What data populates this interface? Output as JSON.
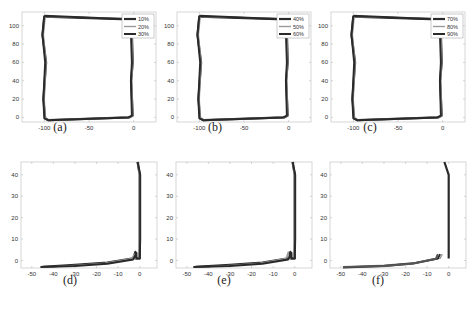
{
  "chart_data": [
    {
      "id": "a",
      "caption": "(a)",
      "type": "line",
      "xlim": [
        -125,
        25
      ],
      "ylim": [
        -5,
        115
      ],
      "xticks": [
        -100,
        -50,
        0
      ],
      "yticks": [
        0,
        20,
        40,
        60,
        80,
        100
      ],
      "legend": [
        "10%",
        "20%",
        "30%"
      ],
      "legend_position": "upper right",
      "series": [
        {
          "name": "10%",
          "path": [
            [
              -100,
              110
            ],
            [
              -5,
              107
            ],
            [
              -2,
              90
            ],
            [
              -1,
              60
            ],
            [
              -3,
              40
            ],
            [
              -1,
              2
            ],
            [
              -5,
              0
            ],
            [
              -95,
              -3
            ],
            [
              -99,
              -1
            ],
            [
              -101,
              20
            ],
            [
              -98,
              60
            ],
            [
              -102,
              90
            ],
            [
              -100,
              110
            ]
          ]
        },
        {
          "name": "20%",
          "path": [
            [
              -99,
              110
            ],
            [
              -5,
              108
            ],
            [
              -2,
              90
            ],
            [
              -1,
              60
            ],
            [
              -2,
              40
            ],
            [
              -1,
              2
            ],
            [
              -5,
              0
            ],
            [
              -95,
              -3
            ],
            [
              -99,
              -1
            ],
            [
              -100,
              20
            ],
            [
              -98,
              60
            ],
            [
              -101,
              90
            ],
            [
              -99,
              110
            ]
          ]
        },
        {
          "name": "30%",
          "path": [
            [
              -100,
              111
            ],
            [
              -6,
              107
            ],
            [
              -3,
              90
            ],
            [
              -2,
              60
            ],
            [
              -3,
              40
            ],
            [
              -2,
              2
            ],
            [
              -6,
              0
            ],
            [
              -96,
              -3
            ],
            [
              -100,
              -1
            ],
            [
              -101,
              20
            ],
            [
              -99,
              60
            ],
            [
              -102,
              90
            ],
            [
              -100,
              111
            ]
          ]
        }
      ]
    },
    {
      "id": "b",
      "caption": "(b)",
      "type": "line",
      "xlim": [
        -125,
        25
      ],
      "ylim": [
        -5,
        115
      ],
      "xticks": [
        -100,
        -50,
        0
      ],
      "yticks": [
        0,
        20,
        40,
        60,
        80,
        100
      ],
      "legend": [
        "40%",
        "50%",
        "60%"
      ],
      "legend_position": "upper right",
      "series": [
        {
          "name": "40%",
          "path": [
            [
              -100,
              110
            ],
            [
              -5,
              107
            ],
            [
              -2,
              90
            ],
            [
              -1,
              60
            ],
            [
              -3,
              40
            ],
            [
              -1,
              2
            ],
            [
              -5,
              0
            ],
            [
              -95,
              -3
            ],
            [
              -99,
              -1
            ],
            [
              -101,
              20
            ],
            [
              -98,
              60
            ],
            [
              -102,
              90
            ],
            [
              -100,
              110
            ]
          ]
        },
        {
          "name": "50%",
          "path": [
            [
              -99,
              110
            ],
            [
              -5,
              108
            ],
            [
              -2,
              90
            ],
            [
              -1,
              60
            ],
            [
              -2,
              40
            ],
            [
              -1,
              2
            ],
            [
              -5,
              0
            ],
            [
              -95,
              -3
            ],
            [
              -99,
              -1
            ],
            [
              -100,
              20
            ],
            [
              -98,
              60
            ],
            [
              -101,
              90
            ],
            [
              -99,
              110
            ]
          ]
        },
        {
          "name": "60%",
          "path": [
            [
              -100,
              111
            ],
            [
              -6,
              107
            ],
            [
              -3,
              90
            ],
            [
              -2,
              60
            ],
            [
              -3,
              40
            ],
            [
              -2,
              2
            ],
            [
              -6,
              0
            ],
            [
              -96,
              -3
            ],
            [
              -100,
              -1
            ],
            [
              -101,
              20
            ],
            [
              -99,
              60
            ],
            [
              -102,
              90
            ],
            [
              -100,
              111
            ]
          ]
        }
      ]
    },
    {
      "id": "c",
      "caption": "(c)",
      "type": "line",
      "xlim": [
        -125,
        25
      ],
      "ylim": [
        -5,
        115
      ],
      "xticks": [
        -100,
        -50,
        0
      ],
      "yticks": [
        0,
        20,
        40,
        60,
        80,
        100
      ],
      "legend": [
        "70%",
        "80%",
        "90%"
      ],
      "legend_position": "upper right",
      "series": [
        {
          "name": "70%",
          "path": [
            [
              -100,
              110
            ],
            [
              -5,
              107
            ],
            [
              -2,
              90
            ],
            [
              -1,
              60
            ],
            [
              -3,
              40
            ],
            [
              -1,
              2
            ],
            [
              -5,
              0
            ],
            [
              -95,
              -3
            ],
            [
              -99,
              -1
            ],
            [
              -101,
              20
            ],
            [
              -98,
              60
            ],
            [
              -102,
              90
            ],
            [
              -100,
              110
            ]
          ]
        },
        {
          "name": "80%",
          "path": [
            [
              -99,
              110
            ],
            [
              -5,
              108
            ],
            [
              -2,
              90
            ],
            [
              -1,
              60
            ],
            [
              -2,
              40
            ],
            [
              -1,
              2
            ],
            [
              -5,
              0
            ],
            [
              -95,
              -3
            ],
            [
              -99,
              -1
            ],
            [
              -100,
              20
            ],
            [
              -98,
              60
            ],
            [
              -101,
              90
            ],
            [
              -99,
              110
            ]
          ]
        },
        {
          "name": "90%",
          "path": [
            [
              -100,
              111
            ],
            [
              -6,
              107
            ],
            [
              -3,
              90
            ],
            [
              -2,
              60
            ],
            [
              -3,
              40
            ],
            [
              -2,
              2
            ],
            [
              -6,
              0
            ],
            [
              -96,
              -3
            ],
            [
              -100,
              -1
            ],
            [
              -101,
              20
            ],
            [
              -99,
              60
            ],
            [
              -102,
              90
            ],
            [
              -100,
              111
            ]
          ]
        }
      ]
    },
    {
      "id": "d",
      "caption": "(d)",
      "type": "line",
      "xlim": [
        -55,
        8
      ],
      "ylim": [
        -3.5,
        46
      ],
      "xticks": [
        -50,
        -40,
        -30,
        -20,
        -10,
        0
      ],
      "yticks": [
        0,
        10,
        20,
        30,
        40
      ],
      "series": [
        {
          "name": "run-1",
          "path": [
            [
              -1,
              46
            ],
            [
              0,
              40
            ],
            [
              0,
              10
            ],
            [
              0,
              1
            ],
            [
              -2,
              1
            ],
            [
              -2,
              4
            ],
            [
              -3,
              1
            ],
            [
              -15,
              -1
            ],
            [
              -30,
              -2
            ],
            [
              -45,
              -3
            ]
          ]
        },
        {
          "name": "run-2",
          "path": [
            [
              -1,
              46
            ],
            [
              -0.3,
              40
            ],
            [
              -0.3,
              10
            ],
            [
              -0.5,
              1
            ],
            [
              -2.5,
              1
            ],
            [
              -2.5,
              3
            ],
            [
              -3.5,
              1
            ],
            [
              -16,
              -1.2
            ],
            [
              -30,
              -2.3
            ],
            [
              -45,
              -3.2
            ]
          ]
        },
        {
          "name": "run-3",
          "path": [
            [
              -1,
              46
            ],
            [
              0.2,
              40
            ],
            [
              0.2,
              10
            ],
            [
              0,
              1
            ],
            [
              -1.5,
              1
            ],
            [
              -1.5,
              3.5
            ],
            [
              -3,
              0.5
            ],
            [
              -15,
              -1.5
            ],
            [
              -30,
              -2.5
            ],
            [
              -46,
              -3
            ]
          ]
        }
      ]
    },
    {
      "id": "e",
      "caption": "(e)",
      "type": "line",
      "xlim": [
        -55,
        8
      ],
      "ylim": [
        -3.5,
        46
      ],
      "xticks": [
        -50,
        -40,
        -30,
        -20,
        -10,
        0
      ],
      "yticks": [
        0,
        10,
        20,
        30,
        40
      ],
      "series": [
        {
          "name": "run-1",
          "path": [
            [
              -1,
              46
            ],
            [
              0,
              40
            ],
            [
              0,
              10
            ],
            [
              0,
              1
            ],
            [
              -2,
              1
            ],
            [
              -2,
              4
            ],
            [
              -3,
              1
            ],
            [
              -15,
              -1
            ],
            [
              -30,
              -2
            ],
            [
              -46,
              -3
            ]
          ]
        },
        {
          "name": "run-2",
          "path": [
            [
              -1,
              46
            ],
            [
              -0.3,
              40
            ],
            [
              -0.3,
              10
            ],
            [
              -0.5,
              1
            ],
            [
              -3,
              1
            ],
            [
              -3,
              4
            ],
            [
              -4,
              1
            ],
            [
              -16,
              -1.2
            ],
            [
              -30,
              -2.3
            ],
            [
              -46,
              -3.2
            ]
          ]
        },
        {
          "name": "run-3",
          "path": [
            [
              -1,
              46
            ],
            [
              0.2,
              40
            ],
            [
              0.2,
              10
            ],
            [
              0,
              1
            ],
            [
              -1.5,
              1
            ],
            [
              -1.5,
              3.5
            ],
            [
              -3,
              0.5
            ],
            [
              -15,
              -1.5
            ],
            [
              -30,
              -2.5
            ],
            [
              -47,
              -3
            ]
          ]
        }
      ]
    },
    {
      "id": "f",
      "caption": "(f)",
      "type": "line",
      "xlim": [
        -55,
        8
      ],
      "ylim": [
        -3.5,
        46
      ],
      "xticks": [
        -50,
        -40,
        -30,
        -20,
        -10,
        0
      ],
      "yticks": [
        0,
        10,
        20,
        30,
        40
      ],
      "series": [
        {
          "name": "run-1",
          "path": [
            [
              -2,
              46
            ],
            [
              0,
              40
            ],
            [
              0,
              10
            ],
            [
              0,
              1
            ]
          ]
        },
        {
          "name": "run-2",
          "path": [
            [
              -3,
              3
            ],
            [
              -4,
              1
            ],
            [
              -15,
              -1
            ],
            [
              -30,
              -2.2
            ],
            [
              -48,
              -3
            ]
          ]
        },
        {
          "name": "run-3",
          "path": [
            [
              -4,
              3
            ],
            [
              -5,
              1
            ],
            [
              -16,
              -1.3
            ],
            [
              -30,
              -2.5
            ],
            [
              -49,
              -3.2
            ]
          ]
        },
        {
          "name": "run-4",
          "path": [
            [
              -5,
              3
            ],
            [
              -6,
              0.8
            ],
            [
              -17,
              -1.5
            ],
            [
              -30,
              -2.6
            ],
            [
              -49,
              -3
            ]
          ]
        }
      ]
    }
  ],
  "colors": {
    "line_dark": "#2a2a2a",
    "line_mid": "#555555",
    "line_light": "#9a9a9a",
    "axis": "#cccccc"
  }
}
